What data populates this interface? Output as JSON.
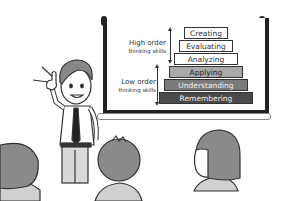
{
  "illustration": {
    "subject": "Teacher presenting Bloom's taxonomy pyramid to students",
    "pyramid": {
      "levels": [
        {
          "label": "Creating",
          "fill": "#ffffff",
          "text": "#333333"
        },
        {
          "label": "Evaluating",
          "fill": "#ffffff",
          "text": "#333333"
        },
        {
          "label": "Analyzing",
          "fill": "#ffffff",
          "text": "#333333"
        },
        {
          "label": "Applying",
          "fill": "#a8a8a8",
          "text": "#222222"
        },
        {
          "label": "Understanding",
          "fill": "#7a7a7a",
          "text": "#eeeeee"
        },
        {
          "label": "Remembering",
          "fill": "#4a4a4a",
          "text": "#f0f0f0"
        }
      ]
    },
    "groups": {
      "high": {
        "line1": "High order",
        "line2": "thinking skills"
      },
      "low": {
        "line1": "Low order",
        "line2": "thinking skills"
      }
    }
  }
}
